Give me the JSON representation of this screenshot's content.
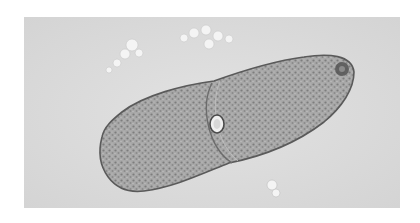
{
  "image": {
    "subject": "ciliate cell (paramecium-like) undergoing division, micrograph",
    "colors": {
      "background_page": "#ffffff",
      "field": "#dcdcdc",
      "cell_fill": "#a6a6a6",
      "cell_edge": "#5a5a5a",
      "debris": "#f2f2f2"
    }
  }
}
